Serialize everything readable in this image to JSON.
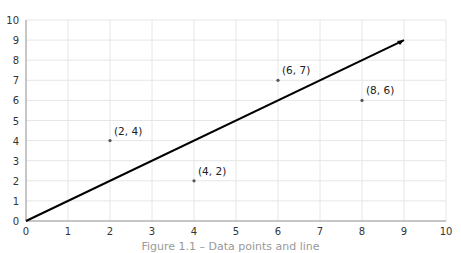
{
  "chart_data": {
    "type": "scatter",
    "title": "",
    "xlabel": "",
    "ylabel": "",
    "xlim": [
      0,
      10
    ],
    "ylim": [
      0,
      10
    ],
    "grid": true,
    "x_ticks": [
      "0",
      "1",
      "2",
      "3",
      "4",
      "5",
      "6",
      "7",
      "8",
      "9",
      "10"
    ],
    "y_ticks": [
      "0",
      "1",
      "2",
      "3",
      "4",
      "5",
      "6",
      "7",
      "8",
      "9",
      "10"
    ],
    "series": [
      {
        "name": "points",
        "type": "scatter",
        "points": [
          {
            "x": 2,
            "y": 4,
            "label": "(2, 4)"
          },
          {
            "x": 4,
            "y": 2,
            "label": "(4, 2)"
          },
          {
            "x": 6,
            "y": 7,
            "label": "(6, 7)"
          },
          {
            "x": 8,
            "y": 6,
            "label": "(8, 6)"
          }
        ]
      },
      {
        "name": "line y = x",
        "type": "line",
        "points": [
          {
            "x": 0,
            "y": 0
          },
          {
            "x": 9,
            "y": 9
          }
        ],
        "color": "#000000"
      }
    ],
    "caption": "Figure 1.1 – Data points and line"
  },
  "colors": {
    "grid": "#e6e6e6",
    "axis": "#999999",
    "line": "#000000",
    "point": "#555555"
  }
}
